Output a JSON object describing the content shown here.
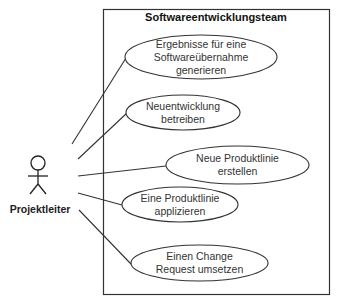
{
  "diagram": {
    "type": "uml-use-case",
    "system_boundary": {
      "title": "Softwareentwicklungsteam"
    },
    "actor": {
      "name": "Projektleiter"
    },
    "use_cases": [
      {
        "line1": "Ergebnisse für eine",
        "line2": "Softwareübernahme",
        "line3": "generieren"
      },
      {
        "line1": "Neuentwicklung",
        "line2": "betreiben"
      },
      {
        "line1": "Neue Produktlinie",
        "line2": "erstellen"
      },
      {
        "line1": "Eine Produktlinie",
        "line2": "applizieren"
      },
      {
        "line1": "Einen Change",
        "line2": "Request umsetzen"
      }
    ],
    "colors": {
      "stroke": "#333333",
      "background": "#ffffff"
    }
  }
}
